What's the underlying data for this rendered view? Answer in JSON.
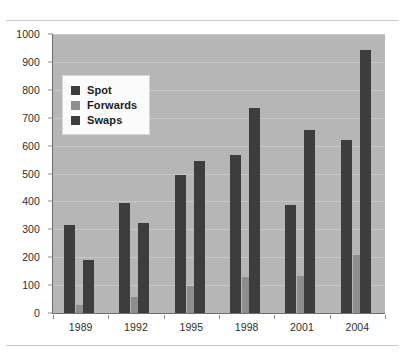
{
  "chart_data": {
    "type": "bar",
    "title": "",
    "subtitle": "",
    "xlabel": "",
    "ylabel": "",
    "categories": [
      "1989",
      "1992",
      "1995",
      "1998",
      "2001",
      "2004"
    ],
    "series": [
      {
        "name": "Spot",
        "color": "#3d3d3d",
        "values": [
          317,
          394,
          494,
          568,
          387,
          621
        ]
      },
      {
        "name": "Forwards",
        "color": "#8e8e8e",
        "values": [
          27,
          58,
          97,
          128,
          131,
          208
        ]
      },
      {
        "name": "Swaps",
        "color": "#3d3d3d",
        "values": [
          190,
          324,
          546,
          734,
          656,
          944
        ]
      }
    ],
    "ylim": [
      0,
      1000
    ],
    "ytick_values": [
      0,
      100,
      200,
      300,
      400,
      500,
      600,
      700,
      800,
      900,
      1000
    ],
    "ytick_labels": [
      "0",
      "100",
      "200",
      "300",
      "400",
      "500",
      "600",
      "700",
      "800",
      "900",
      "1000"
    ],
    "grid": true,
    "grid_axis": "y",
    "legend_position": "upper-left-inside",
    "plot_background": "#b6b6b6",
    "figure_background": "#ffffff",
    "gridline_color": "#c8c8c8",
    "axis_color": "#6f6f6f"
  },
  "legend": {
    "entries": [
      {
        "label": "Spot",
        "swatch_color": "#3d3d3d"
      },
      {
        "label": "Forwards",
        "swatch_color": "#8e8e8e"
      },
      {
        "label": "Swaps",
        "swatch_color": "#3d3d3d"
      }
    ]
  },
  "rules": {
    "top_divider_color": "#c9c9c9",
    "bottom_divider_color": "#c9c9c9"
  }
}
